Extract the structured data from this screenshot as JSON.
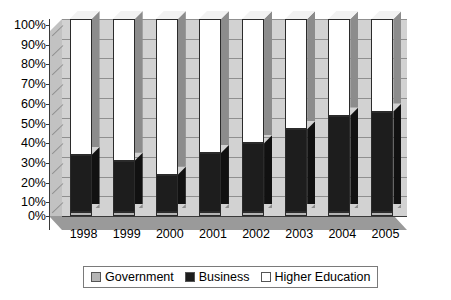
{
  "chart_data": {
    "type": "bar",
    "subtype": "100% stacked column (3D)",
    "title": "",
    "xlabel": "",
    "ylabel": "",
    "categories": [
      "1998",
      "1999",
      "2000",
      "2001",
      "2002",
      "2003",
      "2004",
      "2005"
    ],
    "series": [
      {
        "name": "Government",
        "color": "#b5b5b5",
        "values": [
          2,
          2,
          2,
          2,
          2,
          2,
          2,
          2
        ]
      },
      {
        "name": "Business",
        "color": "#1d1d1d",
        "values": [
          29,
          26,
          19,
          30,
          35,
          42,
          49,
          51
        ]
      },
      {
        "name": "Higher Education",
        "color": "#ffffff",
        "values": [
          69,
          72,
          79,
          68,
          63,
          56,
          49,
          47
        ]
      }
    ],
    "cumulative_tops": {
      "Government": [
        2,
        2,
        2,
        2,
        2,
        2,
        2,
        2
      ],
      "Business": [
        31,
        28,
        21,
        32,
        37,
        44,
        51,
        53
      ],
      "Higher Education": [
        100,
        100,
        100,
        100,
        100,
        100,
        100,
        100
      ]
    },
    "ylim": [
      0,
      100
    ],
    "ytick_labels": [
      "0%",
      "10%",
      "20%",
      "30%",
      "40%",
      "50%",
      "60%",
      "70%",
      "80%",
      "90%",
      "100%"
    ],
    "ytick_values": [
      0,
      10,
      20,
      30,
      40,
      50,
      60,
      70,
      80,
      90,
      100
    ],
    "grid": true,
    "legend_position": "bottom"
  },
  "legend": {
    "items": [
      {
        "label": "Government",
        "swatch": "gov-swatch-icon"
      },
      {
        "label": "Business",
        "swatch": "business-swatch-icon"
      },
      {
        "label": "Higher Education",
        "swatch": "higher-education-swatch-icon"
      }
    ]
  },
  "colors": {
    "government": "#b5b5b5",
    "business": "#1d1d1d",
    "higher_education": "#ffffff",
    "plot_wall": "#d2d2d2",
    "floor": "#9a9a9a",
    "gridline": "#8f8f8f",
    "axis": "#3a3a3a"
  }
}
